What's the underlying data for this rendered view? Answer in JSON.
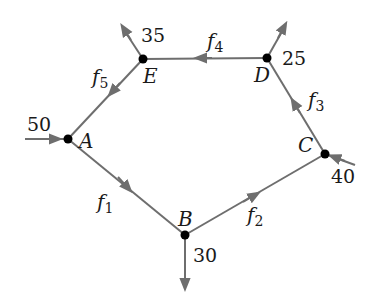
{
  "diagram": {
    "type": "network-flow",
    "nodes": [
      {
        "id": "A",
        "label": "A",
        "x": 68,
        "y": 139
      },
      {
        "id": "B",
        "label": "B",
        "x": 185,
        "y": 235
      },
      {
        "id": "C",
        "label": "C",
        "x": 325,
        "y": 154
      },
      {
        "id": "D",
        "label": "D",
        "x": 267,
        "y": 58
      },
      {
        "id": "E",
        "label": "E",
        "x": 143,
        "y": 59
      }
    ],
    "edges": [
      {
        "from": "A",
        "to": "B",
        "label": "f",
        "sub": "1"
      },
      {
        "from": "B",
        "to": "C",
        "label": "f",
        "sub": "2"
      },
      {
        "from": "C",
        "to": "D",
        "label": "f",
        "sub": "3"
      },
      {
        "from": "D",
        "to": "E",
        "label": "f",
        "sub": "4"
      },
      {
        "from": "E",
        "to": "A",
        "label": "f",
        "sub": "5"
      }
    ],
    "external_flows": [
      {
        "node": "A",
        "direction": "in",
        "value": "50"
      },
      {
        "node": "B",
        "direction": "out",
        "value": "30"
      },
      {
        "node": "C",
        "direction": "in",
        "value": "40"
      },
      {
        "node": "D",
        "direction": "out",
        "value": "25"
      },
      {
        "node": "E",
        "direction": "out",
        "value": "35"
      }
    ],
    "colors": {
      "edge": "#6e6e6e",
      "node": "#000000",
      "text": "#1a1a1a"
    }
  }
}
